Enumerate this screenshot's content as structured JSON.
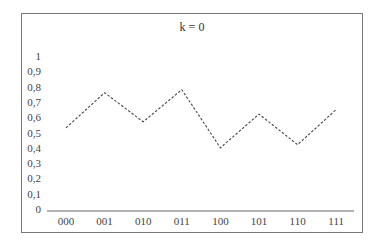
{
  "chart_data": {
    "type": "line",
    "title": "k = 0",
    "xlabel": "",
    "ylabel": "",
    "categories": [
      "000",
      "001",
      "010",
      "011",
      "100",
      "101",
      "110",
      "111"
    ],
    "series": [
      {
        "name": "k = 0",
        "values": [
          0.53,
          0.76,
          0.57,
          0.78,
          0.4,
          0.62,
          0.42,
          0.65
        ],
        "style": "dashed",
        "color": "#444444"
      }
    ],
    "yticks": [
      "0",
      "0,1",
      "0,2",
      "0,3",
      "0,4",
      "0,5",
      "0,6",
      "0,7",
      "0,8",
      "0,9",
      "1"
    ],
    "ylim": [
      0,
      1
    ],
    "grid": false,
    "legend": "none"
  }
}
